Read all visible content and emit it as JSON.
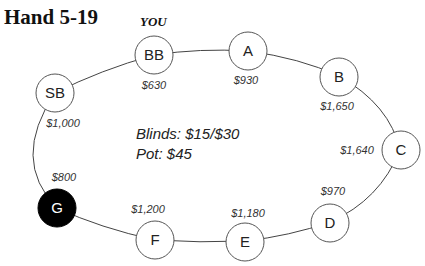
{
  "title": "Hand 5-19",
  "hero_label": "YOU",
  "table": {
    "blinds": "Blinds: $15/$30",
    "pot": "Pot: $45"
  },
  "seats": [
    {
      "label": "BB",
      "stack": "$630",
      "hero": true,
      "highlighted": false
    },
    {
      "label": "A",
      "stack": "$930",
      "hero": false,
      "highlighted": false
    },
    {
      "label": "B",
      "stack": "$1,650",
      "hero": false,
      "highlighted": false
    },
    {
      "label": "C",
      "stack": "$1,640",
      "hero": false,
      "highlighted": false
    },
    {
      "label": "D",
      "stack": "$970",
      "hero": false,
      "highlighted": false
    },
    {
      "label": "E",
      "stack": "$1,180",
      "hero": false,
      "highlighted": false
    },
    {
      "label": "F",
      "stack": "$1,200",
      "hero": false,
      "highlighted": false
    },
    {
      "label": "G",
      "stack": "$800",
      "hero": false,
      "highlighted": true
    },
    {
      "label": "SB",
      "stack": "$1,000",
      "hero": false,
      "highlighted": false
    }
  ],
  "colors": {
    "highlight_fill": "#000000",
    "seat_fill": "#ffffff",
    "line": "#444444"
  }
}
